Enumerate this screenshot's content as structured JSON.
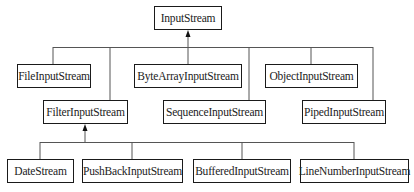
{
  "diagram": {
    "root": {
      "label": "InputStream"
    },
    "level1": [
      {
        "label": "FileInputStream"
      },
      {
        "label": "FilterInputStream"
      },
      {
        "label": "ByteArrayInputStream"
      },
      {
        "label": "SequenceInputStream"
      },
      {
        "label": "ObjectInputStream"
      },
      {
        "label": "PipedInputStream"
      }
    ],
    "filter_children": [
      {
        "label": "DateStream"
      },
      {
        "label": "PushBackInputStream"
      },
      {
        "label": "BufferedInputStream"
      },
      {
        "label": "LineNumberInputStream"
      }
    ],
    "colors": {
      "line": "#555555",
      "border": "#1a1a1a",
      "text": "#222222"
    }
  }
}
